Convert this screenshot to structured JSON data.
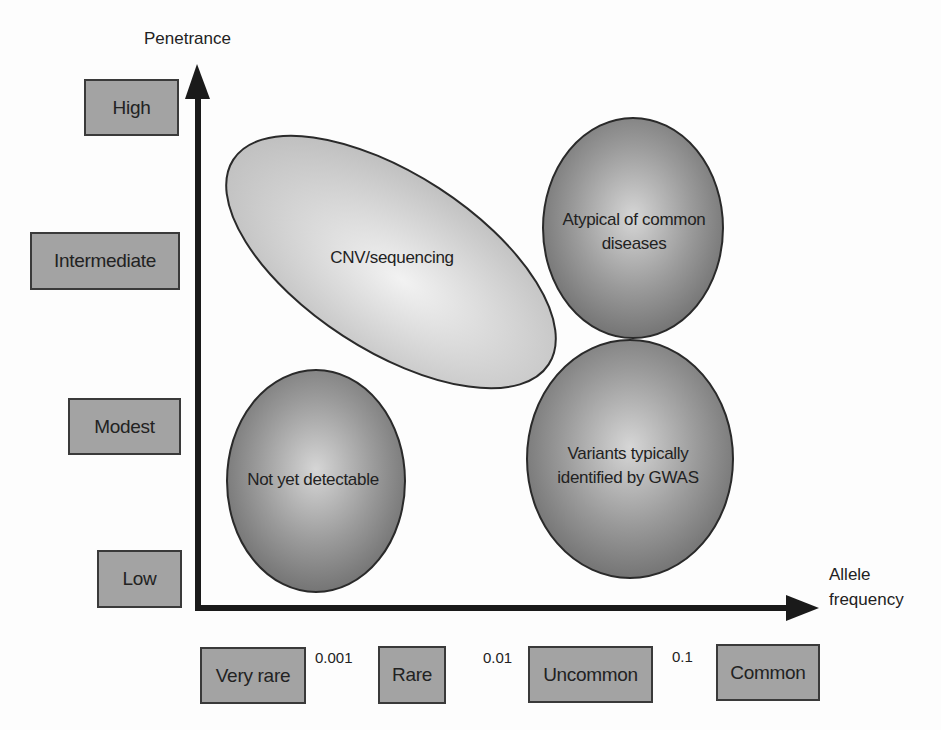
{
  "diagram": {
    "y_axis": {
      "title": "Penetrance",
      "levels": [
        "High",
        "Intermediate",
        "Modest",
        "Low"
      ]
    },
    "x_axis": {
      "title_line1": "Allele",
      "title_line2": "frequency",
      "categories": [
        "Very rare",
        "Rare",
        "Uncommon",
        "Common"
      ],
      "thresholds": [
        "0.001",
        "0.01",
        "0.1"
      ]
    },
    "regions": [
      {
        "label": "CNV/sequencing",
        "shade": "light"
      },
      {
        "label_line1": "Atypical of common",
        "label_line2": "diseases",
        "shade": "dark"
      },
      {
        "label": "Not yet detectable",
        "shade": "dark"
      },
      {
        "label_line1": "Variants typically",
        "label_line2": "identified by GWAS",
        "shade": "dark"
      }
    ],
    "colors": {
      "box_fill": "#a3a3a3",
      "axis": "#1a1a1a",
      "light_region": "#c8c8c8",
      "dark_region": "#7a7a7a"
    }
  }
}
